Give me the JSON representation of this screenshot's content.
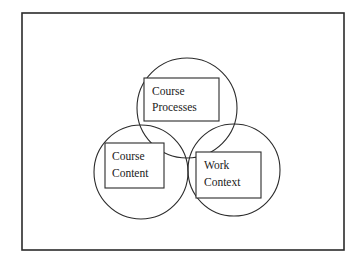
{
  "figure": {
    "type": "venn-three-circle",
    "background_color": "#ffffff",
    "stroke_color": "#2b2b2b",
    "frame": {
      "label": "outer-border",
      "x": 22,
      "y": 13,
      "width": 322,
      "height": 237,
      "stroke_width": 1.6
    },
    "circles": [
      {
        "id": "top",
        "name": "course-processes-circle",
        "cx": 187,
        "cy": 108,
        "r": 50,
        "stroke_width": 1.1
      },
      {
        "id": "left",
        "name": "course-content-circle",
        "cx": 141,
        "cy": 172,
        "r": 47,
        "stroke_width": 1.1
      },
      {
        "id": "right",
        "name": "work-context-circle",
        "cx": 234,
        "cy": 170,
        "r": 46,
        "stroke_width": 1.1
      }
    ],
    "boxes": [
      {
        "id": "top",
        "name": "course-processes-box",
        "x": 144,
        "y": 78,
        "width": 75,
        "height": 43,
        "stroke_width": 1.1,
        "lines": [
          "Course",
          "Processes"
        ],
        "text_x": 152,
        "line_y": [
          92,
          108
        ]
      },
      {
        "id": "left",
        "name": "course-content-box",
        "x": 105,
        "y": 143,
        "width": 59,
        "height": 45,
        "stroke_width": 1.1,
        "lines": [
          "Course",
          "Content"
        ],
        "text_x": 112,
        "line_y": [
          157,
          174
        ]
      },
      {
        "id": "right",
        "name": "work-context-box",
        "x": 196,
        "y": 152,
        "width": 65,
        "height": 46,
        "stroke_width": 1.1,
        "lines": [
          "Work",
          "Context"
        ],
        "text_x": 204,
        "line_y": [
          166,
          183
        ]
      }
    ]
  },
  "labels": {
    "course_processes_line1": "Course",
    "course_processes_line2": "Processes",
    "course_content_line1": "Course",
    "course_content_line2": "Content",
    "work_context_line1": "Work",
    "work_context_line2": "Context"
  }
}
